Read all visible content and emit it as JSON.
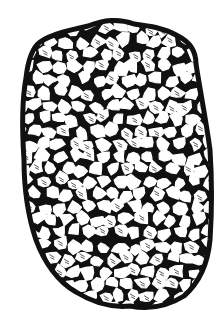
{
  "image": {
    "subject": "porous sponge-like mass illustration",
    "style": "black ink woodcut line drawing",
    "colors": {
      "ink": "#111111",
      "background": "#ffffff"
    },
    "width": 224,
    "height": 328
  }
}
